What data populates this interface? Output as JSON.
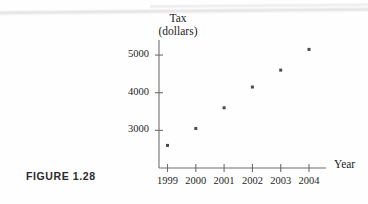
{
  "figure": {
    "caption": "FIGURE 1.28"
  },
  "chart_data": {
    "type": "scatter",
    "title": "",
    "xlabel": "Year",
    "ylabel": "Tax (dollars)",
    "ylabel_line1": "Tax",
    "ylabel_line2": "(dollars)",
    "categories": [
      "1999",
      "2000",
      "2001",
      "2002",
      "2003",
      "2004"
    ],
    "x": [
      1999,
      2000,
      2001,
      2002,
      2003,
      2004
    ],
    "values": [
      2600,
      3050,
      3600,
      4150,
      4600,
      5150
    ],
    "xticklabels": [
      "1999",
      "2000",
      "2001",
      "2002",
      "2003",
      "2004"
    ],
    "yticklabels": [
      "3000",
      "4000",
      "5000"
    ],
    "yticks": [
      3000,
      4000,
      5000
    ],
    "xlim": [
      1998.7,
      2004.6
    ],
    "ylim": [
      2000,
      5400
    ],
    "grid": false,
    "legend": null,
    "marker": "dot",
    "marker_color": "#4a4a4a",
    "axis_color": "#6e6e6e",
    "text_color": "#1f1f1f"
  }
}
